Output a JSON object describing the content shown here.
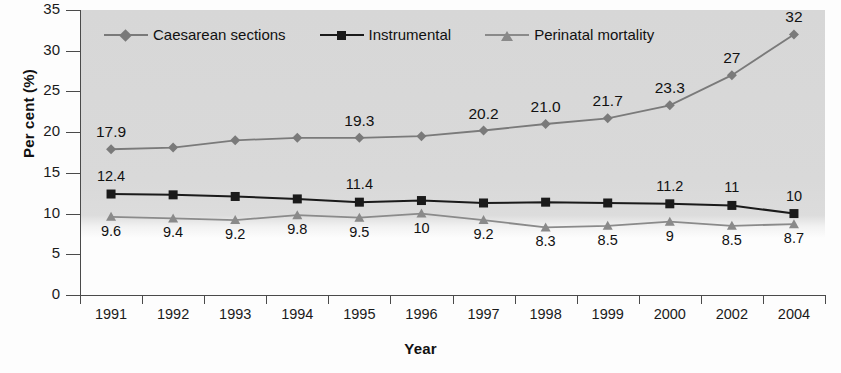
{
  "chart_data": {
    "type": "line",
    "title": "",
    "xlabel": "Year",
    "ylabel": "Per cent (%)",
    "categories": [
      "1991",
      "1992",
      "1993",
      "1994",
      "1995",
      "1996",
      "1997",
      "1998",
      "1999",
      "2000",
      "2002",
      "2004"
    ],
    "ylim": [
      0,
      35
    ],
    "yticks": [
      "0",
      "5",
      "10",
      "15",
      "20",
      "25",
      "30",
      "35"
    ],
    "grid": false,
    "legend_position": "top-inside",
    "plot_background": "#d8d8d8",
    "series": [
      {
        "name": "Caesarean sections",
        "marker": "diamond",
        "color": "#7a7a7a",
        "values": [
          17.9,
          18.1,
          19.0,
          19.3,
          19.3,
          19.5,
          20.2,
          21.0,
          21.7,
          23.3,
          27,
          32
        ],
        "labels": [
          "17.9",
          "",
          "",
          "",
          "19.3",
          "",
          "20.2",
          "21.0",
          "21.7",
          "23.3",
          "27",
          "32"
        ]
      },
      {
        "name": "Instrumental",
        "marker": "square",
        "color": "#1a1a1a",
        "values": [
          12.4,
          12.3,
          12.1,
          11.8,
          11.4,
          11.6,
          11.3,
          11.4,
          11.3,
          11.2,
          11.0,
          10.0
        ],
        "labels": [
          "12.4",
          "",
          "",
          "",
          "11.4",
          "",
          "",
          "",
          "",
          "11.2",
          "11",
          "10"
        ]
      },
      {
        "name": "Perinatal mortality",
        "marker": "triangle",
        "color": "#8a8a8a",
        "values": [
          9.6,
          9.4,
          9.2,
          9.8,
          9.5,
          10.0,
          9.2,
          8.3,
          8.5,
          9.0,
          8.5,
          8.7
        ],
        "labels": [
          "9.6",
          "9.4",
          "9.2",
          "9.8",
          "9.5",
          "10",
          "9.2",
          "8.3",
          "8.5",
          "9",
          "8.5",
          "8.7"
        ]
      }
    ]
  }
}
